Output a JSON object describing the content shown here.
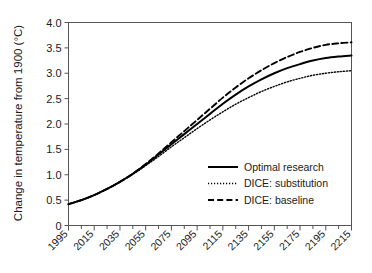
{
  "chart_data": {
    "type": "line",
    "title": "",
    "xlabel": "",
    "ylabel": "Change in temperature from 1900 (°C)",
    "xlim": [
      1995,
      2215
    ],
    "ylim": [
      0,
      4.0
    ],
    "grid": false,
    "legend_position": "inside-right-lower",
    "x_tick_labels": [
      "1995",
      "2015",
      "2035",
      "2055",
      "2075",
      "2095",
      "2115",
      "2135",
      "2155",
      "2175",
      "2195",
      "2215"
    ],
    "x_tick_values": [
      1995,
      2015,
      2035,
      2055,
      2075,
      2095,
      2115,
      2135,
      2155,
      2175,
      2195,
      2215
    ],
    "x_minor_interval": 10,
    "y_tick_labels": [
      "0",
      "0.5",
      "1.0",
      "1.5",
      "2.0",
      "2.5",
      "3.0",
      "3.5",
      "4.0"
    ],
    "y_tick_values": [
      0,
      0.5,
      1.0,
      1.5,
      2.0,
      2.5,
      3.0,
      3.5,
      4.0
    ],
    "x": [
      1995,
      2005,
      2015,
      2025,
      2035,
      2045,
      2055,
      2065,
      2075,
      2085,
      2095,
      2105,
      2115,
      2125,
      2135,
      2145,
      2155,
      2165,
      2175,
      2185,
      2195,
      2205,
      2215
    ],
    "series": [
      {
        "name": "Optimal research",
        "style": "solid",
        "color": "#000000",
        "values": [
          0.42,
          0.5,
          0.6,
          0.72,
          0.86,
          1.02,
          1.2,
          1.4,
          1.6,
          1.8,
          2.0,
          2.2,
          2.4,
          2.58,
          2.74,
          2.88,
          3.0,
          3.1,
          3.18,
          3.25,
          3.3,
          3.33,
          3.35
        ]
      },
      {
        "name": "DICE: substitution",
        "style": "dotted",
        "color": "#000000",
        "values": [
          0.42,
          0.5,
          0.6,
          0.72,
          0.86,
          1.01,
          1.18,
          1.36,
          1.55,
          1.73,
          1.91,
          2.08,
          2.24,
          2.39,
          2.52,
          2.64,
          2.74,
          2.83,
          2.9,
          2.96,
          3.0,
          3.03,
          3.05
        ]
      },
      {
        "name": "DICE: baseline",
        "style": "dashed",
        "color": "#000000",
        "values": [
          0.42,
          0.5,
          0.6,
          0.72,
          0.86,
          1.02,
          1.21,
          1.42,
          1.64,
          1.86,
          2.08,
          2.3,
          2.52,
          2.72,
          2.9,
          3.06,
          3.2,
          3.32,
          3.42,
          3.5,
          3.56,
          3.59,
          3.61
        ]
      }
    ]
  },
  "legend": {
    "entries": [
      {
        "label": "Optimal research",
        "style": "solid"
      },
      {
        "label": "DICE: substitution",
        "style": "dotted"
      },
      {
        "label": "DICE: baseline",
        "style": "dashed"
      }
    ]
  },
  "axes": {
    "y_title": "Change in temperature from 1900 (°C)"
  },
  "colors": {
    "foreground": "#000000",
    "axis": "#555555",
    "background": "#ffffff"
  }
}
